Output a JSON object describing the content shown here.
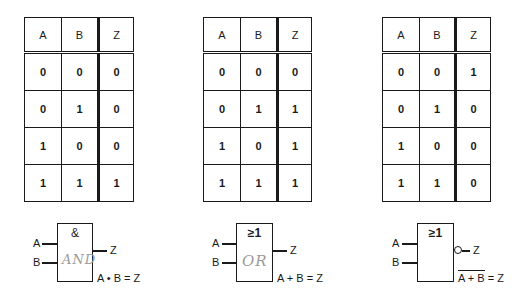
{
  "tables": [
    {
      "gate": "AND",
      "headers": [
        "A",
        "B",
        "Z"
      ],
      "rows": [
        [
          "0",
          "0",
          "0"
        ],
        [
          "0",
          "1",
          "0"
        ],
        [
          "1",
          "0",
          "0"
        ],
        [
          "1",
          "1",
          "1"
        ]
      ]
    },
    {
      "gate": "OR",
      "headers": [
        "A",
        "B",
        "Z"
      ],
      "rows": [
        [
          "0",
          "0",
          "0"
        ],
        [
          "0",
          "1",
          "1"
        ],
        [
          "1",
          "0",
          "1"
        ],
        [
          "1",
          "1",
          "1"
        ]
      ]
    },
    {
      "gate": "NOR",
      "headers": [
        "A",
        "B",
        "Z"
      ],
      "rows": [
        [
          "0",
          "0",
          "1"
        ],
        [
          "0",
          "1",
          "0"
        ],
        [
          "1",
          "0",
          "0"
        ],
        [
          "1",
          "1",
          "0"
        ]
      ]
    }
  ],
  "gates": [
    {
      "symbol": "&",
      "input_a": "A",
      "input_b": "B",
      "output": "Z",
      "handwritten": "AND",
      "equation": "A • B = Z",
      "inverted": false
    },
    {
      "symbol": "≥1",
      "input_a": "A",
      "input_b": "B",
      "output": "Z",
      "handwritten": "OR",
      "equation": "A + B = Z",
      "inverted": false
    },
    {
      "symbol": "≥1",
      "input_a": "A",
      "input_b": "B",
      "output": "Z",
      "handwritten": "",
      "equation_overbar": "A + B",
      "equation_rhs": " = Z",
      "inverted": true
    }
  ]
}
